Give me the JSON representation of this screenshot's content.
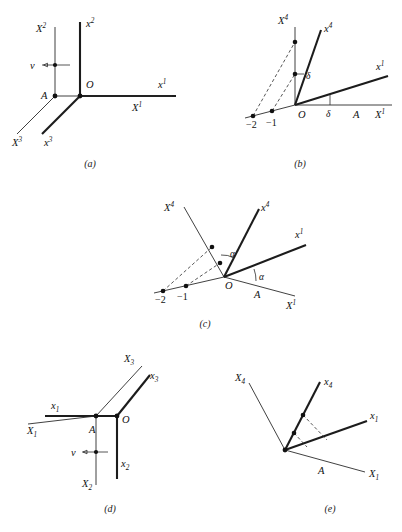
{
  "figure": {
    "panels": [
      {
        "id": "a",
        "caption": "(a)",
        "labels": {
          "cap_X2": "X",
          "cap_X2_sup": "2",
          "low_x2": "x",
          "low_x2_sup": "2",
          "cap_X1": "X",
          "cap_X1_sup": "1",
          "low_x1": "x",
          "low_x1_sup": "1",
          "cap_X3": "X",
          "cap_X3_sup": "3",
          "low_x3": "x",
          "low_x3_sup": "3",
          "origin": "O",
          "point_A": "A",
          "velocity": "v"
        }
      },
      {
        "id": "b",
        "caption": "(b)",
        "labels": {
          "cap_X4": "X",
          "cap_X4_sup": "4",
          "low_x4": "x",
          "low_x4_sup": "4",
          "cap_X1": "X",
          "cap_X1_sup": "1",
          "low_x1": "x",
          "low_x1_sup": "1",
          "origin": "O",
          "point_A": "A",
          "tick_minus_two": "−2",
          "tick_minus_one": "−1",
          "angle_upper": "δ",
          "angle_lower": "δ"
        }
      },
      {
        "id": "c",
        "caption": "(c)",
        "labels": {
          "cap_X4": "X",
          "cap_X4_sup": "4",
          "low_x4": "x",
          "low_x4_sup": "4",
          "cap_X1": "X",
          "cap_X1_sup": "1",
          "low_x1": "x",
          "low_x1_sup": "1",
          "origin": "O",
          "point_A": "A",
          "tick_minus_two": "−2",
          "tick_minus_one": "−1",
          "angle_upper": "α",
          "angle_lower": "α"
        }
      },
      {
        "id": "d",
        "caption": "(d)",
        "labels": {
          "cap_X3": "X",
          "cap_X3_sub": "3",
          "low_x3": "x",
          "low_x3_sub": "3",
          "cap_X1": "X",
          "cap_X1_sub": "1",
          "low_x1": "x",
          "low_x1_sub": "1",
          "cap_X2": "X",
          "cap_X2_sub": "2",
          "low_x2": "x",
          "low_x2_sub": "2",
          "origin": "O",
          "point_A": "A",
          "velocity": "v"
        }
      },
      {
        "id": "e",
        "caption": "(e)",
        "labels": {
          "cap_X4": "X",
          "cap_X4_sub": "4",
          "low_x4": "x",
          "low_x4_sub": "4",
          "cap_X1": "X",
          "cap_X1_sub": "1",
          "low_x1": "x",
          "low_x1_sub": "1",
          "point_A": "A"
        }
      }
    ]
  }
}
